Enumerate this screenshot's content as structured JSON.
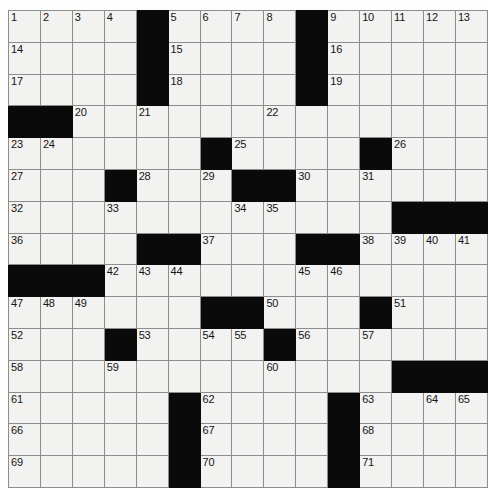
{
  "puzzle": {
    "type": "crossword-grid",
    "rows": 15,
    "columns": 15,
    "colors": {
      "block": "#0a0a0a",
      "cell": "#f2f2f0",
      "grid_line": "#8d8d8d",
      "border": "#4a4a4a",
      "number_text": "#141414"
    },
    "grid": [
      [
        {
          "block": false,
          "number": "1"
        },
        {
          "block": false,
          "number": "2"
        },
        {
          "block": false,
          "number": "3"
        },
        {
          "block": false,
          "number": "4"
        },
        {
          "block": true,
          "number": ""
        },
        {
          "block": false,
          "number": "5"
        },
        {
          "block": false,
          "number": "6"
        },
        {
          "block": false,
          "number": "7"
        },
        {
          "block": false,
          "number": "8"
        },
        {
          "block": true,
          "number": ""
        },
        {
          "block": false,
          "number": "9"
        },
        {
          "block": false,
          "number": "10"
        },
        {
          "block": false,
          "number": "11"
        },
        {
          "block": false,
          "number": "12"
        },
        {
          "block": false,
          "number": "13"
        }
      ],
      [
        {
          "block": false,
          "number": "14"
        },
        {
          "block": false,
          "number": ""
        },
        {
          "block": false,
          "number": ""
        },
        {
          "block": false,
          "number": ""
        },
        {
          "block": true,
          "number": ""
        },
        {
          "block": false,
          "number": "15"
        },
        {
          "block": false,
          "number": ""
        },
        {
          "block": false,
          "number": ""
        },
        {
          "block": false,
          "number": ""
        },
        {
          "block": true,
          "number": ""
        },
        {
          "block": false,
          "number": "16"
        },
        {
          "block": false,
          "number": ""
        },
        {
          "block": false,
          "number": ""
        },
        {
          "block": false,
          "number": ""
        },
        {
          "block": false,
          "number": ""
        }
      ],
      [
        {
          "block": false,
          "number": "17"
        },
        {
          "block": false,
          "number": ""
        },
        {
          "block": false,
          "number": ""
        },
        {
          "block": false,
          "number": ""
        },
        {
          "block": true,
          "number": ""
        },
        {
          "block": false,
          "number": "18"
        },
        {
          "block": false,
          "number": ""
        },
        {
          "block": false,
          "number": ""
        },
        {
          "block": false,
          "number": ""
        },
        {
          "block": true,
          "number": ""
        },
        {
          "block": false,
          "number": "19"
        },
        {
          "block": false,
          "number": ""
        },
        {
          "block": false,
          "number": ""
        },
        {
          "block": false,
          "number": ""
        },
        {
          "block": false,
          "number": ""
        }
      ],
      [
        {
          "block": true,
          "number": ""
        },
        {
          "block": true,
          "number": ""
        },
        {
          "block": false,
          "number": "20"
        },
        {
          "block": false,
          "number": ""
        },
        {
          "block": false,
          "number": "21"
        },
        {
          "block": false,
          "number": ""
        },
        {
          "block": false,
          "number": ""
        },
        {
          "block": false,
          "number": ""
        },
        {
          "block": false,
          "number": "22"
        },
        {
          "block": false,
          "number": ""
        },
        {
          "block": false,
          "number": ""
        },
        {
          "block": false,
          "number": ""
        },
        {
          "block": false,
          "number": ""
        },
        {
          "block": false,
          "number": ""
        },
        {
          "block": false,
          "number": ""
        }
      ],
      [
        {
          "block": false,
          "number": "23"
        },
        {
          "block": false,
          "number": "24"
        },
        {
          "block": false,
          "number": ""
        },
        {
          "block": false,
          "number": ""
        },
        {
          "block": false,
          "number": ""
        },
        {
          "block": false,
          "number": ""
        },
        {
          "block": true,
          "number": ""
        },
        {
          "block": false,
          "number": "25"
        },
        {
          "block": false,
          "number": ""
        },
        {
          "block": false,
          "number": ""
        },
        {
          "block": false,
          "number": ""
        },
        {
          "block": true,
          "number": ""
        },
        {
          "block": false,
          "number": "26"
        },
        {
          "block": false,
          "number": ""
        },
        {
          "block": false,
          "number": ""
        }
      ],
      [
        {
          "block": false,
          "number": "27"
        },
        {
          "block": false,
          "number": ""
        },
        {
          "block": false,
          "number": ""
        },
        {
          "block": true,
          "number": ""
        },
        {
          "block": false,
          "number": "28"
        },
        {
          "block": false,
          "number": ""
        },
        {
          "block": false,
          "number": "29"
        },
        {
          "block": true,
          "number": ""
        },
        {
          "block": true,
          "number": ""
        },
        {
          "block": false,
          "number": "30"
        },
        {
          "block": false,
          "number": ""
        },
        {
          "block": false,
          "number": "31"
        },
        {
          "block": false,
          "number": ""
        },
        {
          "block": false,
          "number": ""
        },
        {
          "block": false,
          "number": ""
        }
      ],
      [
        {
          "block": false,
          "number": "32"
        },
        {
          "block": false,
          "number": ""
        },
        {
          "block": false,
          "number": ""
        },
        {
          "block": false,
          "number": "33"
        },
        {
          "block": false,
          "number": ""
        },
        {
          "block": false,
          "number": ""
        },
        {
          "block": false,
          "number": ""
        },
        {
          "block": false,
          "number": "34"
        },
        {
          "block": false,
          "number": "35"
        },
        {
          "block": false,
          "number": ""
        },
        {
          "block": false,
          "number": ""
        },
        {
          "block": false,
          "number": ""
        },
        {
          "block": true,
          "number": ""
        },
        {
          "block": true,
          "number": ""
        },
        {
          "block": true,
          "number": ""
        }
      ],
      [
        {
          "block": false,
          "number": "36"
        },
        {
          "block": false,
          "number": ""
        },
        {
          "block": false,
          "number": ""
        },
        {
          "block": false,
          "number": ""
        },
        {
          "block": true,
          "number": ""
        },
        {
          "block": true,
          "number": ""
        },
        {
          "block": false,
          "number": "37"
        },
        {
          "block": false,
          "number": ""
        },
        {
          "block": false,
          "number": ""
        },
        {
          "block": true,
          "number": ""
        },
        {
          "block": true,
          "number": ""
        },
        {
          "block": false,
          "number": "38"
        },
        {
          "block": false,
          "number": "39"
        },
        {
          "block": false,
          "number": "40"
        },
        {
          "block": false,
          "number": "41"
        }
      ],
      [
        {
          "block": true,
          "number": ""
        },
        {
          "block": true,
          "number": ""
        },
        {
          "block": true,
          "number": ""
        },
        {
          "block": false,
          "number": "42"
        },
        {
          "block": false,
          "number": "43"
        },
        {
          "block": false,
          "number": "44"
        },
        {
          "block": false,
          "number": ""
        },
        {
          "block": false,
          "number": ""
        },
        {
          "block": false,
          "number": ""
        },
        {
          "block": false,
          "number": "45"
        },
        {
          "block": false,
          "number": "46"
        },
        {
          "block": false,
          "number": ""
        },
        {
          "block": false,
          "number": ""
        },
        {
          "block": false,
          "number": ""
        },
        {
          "block": false,
          "number": ""
        }
      ],
      [
        {
          "block": false,
          "number": "47"
        },
        {
          "block": false,
          "number": "48"
        },
        {
          "block": false,
          "number": "49"
        },
        {
          "block": false,
          "number": ""
        },
        {
          "block": false,
          "number": ""
        },
        {
          "block": false,
          "number": ""
        },
        {
          "block": true,
          "number": ""
        },
        {
          "block": true,
          "number": ""
        },
        {
          "block": false,
          "number": "50"
        },
        {
          "block": false,
          "number": ""
        },
        {
          "block": false,
          "number": ""
        },
        {
          "block": true,
          "number": ""
        },
        {
          "block": false,
          "number": "51"
        },
        {
          "block": false,
          "number": ""
        },
        {
          "block": false,
          "number": ""
        }
      ],
      [
        {
          "block": false,
          "number": "52"
        },
        {
          "block": false,
          "number": ""
        },
        {
          "block": false,
          "number": ""
        },
        {
          "block": true,
          "number": ""
        },
        {
          "block": false,
          "number": "53"
        },
        {
          "block": false,
          "number": ""
        },
        {
          "block": false,
          "number": "54"
        },
        {
          "block": false,
          "number": "55"
        },
        {
          "block": true,
          "number": ""
        },
        {
          "block": false,
          "number": "56"
        },
        {
          "block": false,
          "number": ""
        },
        {
          "block": false,
          "number": "57"
        },
        {
          "block": false,
          "number": ""
        },
        {
          "block": false,
          "number": ""
        },
        {
          "block": false,
          "number": ""
        }
      ],
      [
        {
          "block": false,
          "number": "58"
        },
        {
          "block": false,
          "number": ""
        },
        {
          "block": false,
          "number": ""
        },
        {
          "block": false,
          "number": "59"
        },
        {
          "block": false,
          "number": ""
        },
        {
          "block": false,
          "number": ""
        },
        {
          "block": false,
          "number": ""
        },
        {
          "block": false,
          "number": ""
        },
        {
          "block": false,
          "number": "60"
        },
        {
          "block": false,
          "number": ""
        },
        {
          "block": false,
          "number": ""
        },
        {
          "block": false,
          "number": ""
        },
        {
          "block": true,
          "number": ""
        },
        {
          "block": true,
          "number": ""
        },
        {
          "block": true,
          "number": ""
        }
      ],
      [
        {
          "block": false,
          "number": "61"
        },
        {
          "block": false,
          "number": ""
        },
        {
          "block": false,
          "number": ""
        },
        {
          "block": false,
          "number": ""
        },
        {
          "block": false,
          "number": ""
        },
        {
          "block": true,
          "number": ""
        },
        {
          "block": false,
          "number": "62"
        },
        {
          "block": false,
          "number": ""
        },
        {
          "block": false,
          "number": ""
        },
        {
          "block": false,
          "number": ""
        },
        {
          "block": true,
          "number": ""
        },
        {
          "block": false,
          "number": "63"
        },
        {
          "block": false,
          "number": ""
        },
        {
          "block": false,
          "number": "64"
        },
        {
          "block": false,
          "number": "65"
        }
      ],
      [
        {
          "block": false,
          "number": "66"
        },
        {
          "block": false,
          "number": ""
        },
        {
          "block": false,
          "number": ""
        },
        {
          "block": false,
          "number": ""
        },
        {
          "block": false,
          "number": ""
        },
        {
          "block": true,
          "number": ""
        },
        {
          "block": false,
          "number": "67"
        },
        {
          "block": false,
          "number": ""
        },
        {
          "block": false,
          "number": ""
        },
        {
          "block": false,
          "number": ""
        },
        {
          "block": true,
          "number": ""
        },
        {
          "block": false,
          "number": "68"
        },
        {
          "block": false,
          "number": ""
        },
        {
          "block": false,
          "number": ""
        },
        {
          "block": false,
          "number": ""
        }
      ],
      [
        {
          "block": false,
          "number": "69"
        },
        {
          "block": false,
          "number": ""
        },
        {
          "block": false,
          "number": ""
        },
        {
          "block": false,
          "number": ""
        },
        {
          "block": false,
          "number": ""
        },
        {
          "block": true,
          "number": ""
        },
        {
          "block": false,
          "number": "70"
        },
        {
          "block": false,
          "number": ""
        },
        {
          "block": false,
          "number": ""
        },
        {
          "block": false,
          "number": ""
        },
        {
          "block": true,
          "number": ""
        },
        {
          "block": false,
          "number": "71"
        },
        {
          "block": false,
          "number": ""
        },
        {
          "block": false,
          "number": ""
        },
        {
          "block": false,
          "number": ""
        }
      ]
    ]
  }
}
